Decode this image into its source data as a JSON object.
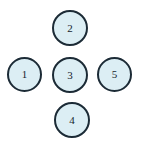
{
  "figure": {
    "type": "node-diagram",
    "layout": "plus-cross",
    "canvas": {
      "width": 141,
      "height": 148,
      "background_color": "#ffffff"
    },
    "style": {
      "node_fill_color": "#dceef4",
      "node_stroke_color": "#1c2b36",
      "node_stroke_width": 2,
      "label_color": "#16242e",
      "node_diameter": 35
    },
    "watermark": {
      "text": "",
      "color": "#fbfcfc"
    },
    "nodes": [
      {
        "id": "node-2",
        "label": "2",
        "position": "top",
        "x": 52,
        "y": 10,
        "diameter": 36
      },
      {
        "id": "node-1",
        "label": "1",
        "position": "left",
        "x": 7,
        "y": 57,
        "diameter": 35
      },
      {
        "id": "node-3",
        "label": "3",
        "position": "center",
        "x": 52,
        "y": 57,
        "diameter": 36
      },
      {
        "id": "node-5",
        "label": "5",
        "position": "right",
        "x": 97,
        "y": 57,
        "diameter": 35
      },
      {
        "id": "node-4",
        "label": "4",
        "position": "bottom",
        "x": 54,
        "y": 102,
        "diameter": 36
      }
    ]
  }
}
